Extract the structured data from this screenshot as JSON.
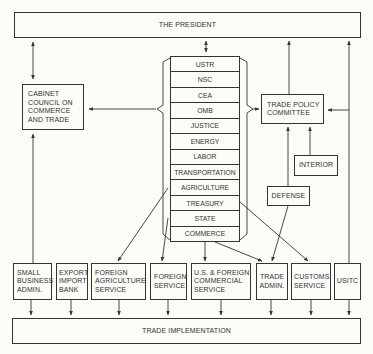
{
  "top": {
    "label": "THE PRESIDENT"
  },
  "bottom": {
    "label": "TRADE IMPLEMENTATION"
  },
  "cabinet_council": {
    "label": "CABINET\nCOUNCIL ON\nCOMMERCE\nAND TRADE"
  },
  "trade_policy_committee": {
    "label": "TRADE POLICY\nCOMMITTEE"
  },
  "interior": {
    "label": "INTERIOR"
  },
  "defense": {
    "label": "DEFENSE"
  },
  "stack": {
    "items": [
      "USTR",
      "NSC",
      "CEA",
      "OMB",
      "JUSTICE",
      "ENERGY",
      "LABOR",
      "TRANSPORTATION",
      "AGRICULTURE",
      "TREASURY",
      "STATE",
      "COMMERCE"
    ]
  },
  "agencies": [
    {
      "label": "SMALL\nBUSINESS\nADMIN."
    },
    {
      "label": "EXPORT\nIMPORT\nBANK"
    },
    {
      "label": "FOREIGN\nAGRICULTURE\nSERVICE"
    },
    {
      "label": "FOREIGN\nSERVICE"
    },
    {
      "label": "U.S. & FOREIGN\nCOMMERCIAL\nSERVICE"
    },
    {
      "label": "TRADE\nADMIN."
    },
    {
      "label": "CUSTOMS\nSERVICE"
    },
    {
      "label": "USITC"
    }
  ],
  "colors": {
    "line": "#333333",
    "background": "#fbfbf8"
  }
}
